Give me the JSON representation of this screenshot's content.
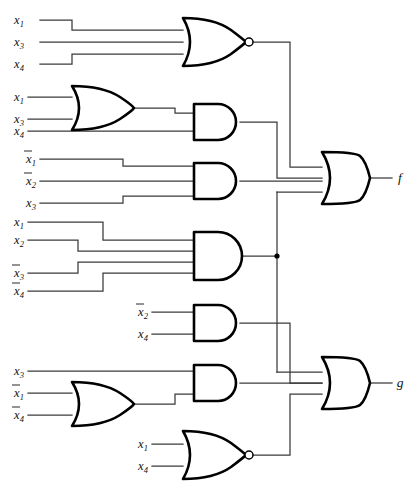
{
  "figure": {
    "type": "logic-circuit-schematic",
    "width": 410,
    "height": 488,
    "background": "#ffffff",
    "wire_color": "#3a3a3a",
    "gate_color": "#000000"
  },
  "outputs": [
    {
      "id": "f",
      "label": "f",
      "expression": "NOR(x1,x3,x4) + (x1+x3)x4 + x1'x2'x3 + x1x2x3'x4'"
    },
    {
      "id": "g",
      "label": "g",
      "expression": "x1x2x3'x4' + x2'x4 + x3(x1'+x4') + NOR(x1,x4)"
    }
  ],
  "inputs": {
    "nor_top": [
      {
        "base": "x",
        "sub": "1",
        "overbar": false
      },
      {
        "base": "x",
        "sub": "3",
        "overbar": false
      },
      {
        "base": "x",
        "sub": "4",
        "overbar": false
      }
    ],
    "or_a": [
      {
        "base": "x",
        "sub": "1",
        "overbar": false
      },
      {
        "base": "x",
        "sub": "3",
        "overbar": false
      }
    ],
    "and_a_direct": [
      {
        "base": "x",
        "sub": "4",
        "overbar": false
      }
    ],
    "and_b": [
      {
        "base": "x",
        "sub": "1",
        "overbar": true
      },
      {
        "base": "x",
        "sub": "2",
        "overbar": true
      },
      {
        "base": "x",
        "sub": "3",
        "overbar": false
      }
    ],
    "and_c": [
      {
        "base": "x",
        "sub": "1",
        "overbar": false
      },
      {
        "base": "x",
        "sub": "2",
        "overbar": false
      },
      {
        "base": "x",
        "sub": "3",
        "overbar": true
      },
      {
        "base": "x",
        "sub": "4",
        "overbar": true
      }
    ],
    "and_d": [
      {
        "base": "x",
        "sub": "2",
        "overbar": true
      },
      {
        "base": "x",
        "sub": "4",
        "overbar": false
      }
    ],
    "and_e_direct": [
      {
        "base": "x",
        "sub": "3",
        "overbar": false
      }
    ],
    "or_b": [
      {
        "base": "x",
        "sub": "1",
        "overbar": true
      },
      {
        "base": "x",
        "sub": "4",
        "overbar": true
      }
    ],
    "nor_bottom": [
      {
        "base": "x",
        "sub": "1",
        "overbar": false
      },
      {
        "base": "x",
        "sub": "4",
        "overbar": false
      }
    ]
  },
  "gates": [
    {
      "id": "nor-top",
      "kind": "NOR",
      "inputs": 3,
      "feeds": "f"
    },
    {
      "id": "or-a",
      "kind": "OR",
      "inputs": 2,
      "feeds": "and-a"
    },
    {
      "id": "and-a",
      "kind": "AND",
      "inputs": 2,
      "feeds": "f"
    },
    {
      "id": "and-b",
      "kind": "AND",
      "inputs": 3,
      "feeds": "f"
    },
    {
      "id": "and-c",
      "kind": "AND",
      "inputs": 4,
      "feeds": "f,g"
    },
    {
      "id": "and-d",
      "kind": "AND",
      "inputs": 2,
      "feeds": "g"
    },
    {
      "id": "or-b",
      "kind": "OR",
      "inputs": 2,
      "feeds": "and-e"
    },
    {
      "id": "and-e",
      "kind": "AND",
      "inputs": 2,
      "feeds": "g"
    },
    {
      "id": "nor-bottom",
      "kind": "NOR",
      "inputs": 2,
      "feeds": "g"
    },
    {
      "id": "or-f",
      "kind": "OR",
      "inputs": 4,
      "feeds": "output-f"
    },
    {
      "id": "or-g",
      "kind": "OR",
      "inputs": 4,
      "feeds": "output-g"
    }
  ]
}
